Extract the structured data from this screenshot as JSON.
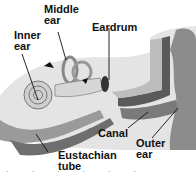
{
  "diagram": {
    "labels": [
      {
        "id": "middle-ear",
        "line1": "Middle",
        "line2": "ear"
      },
      {
        "id": "inner-ear",
        "line1": "Inner",
        "line2": "ear"
      },
      {
        "id": "eardrum",
        "line1": "Eardrum",
        "line2": ""
      },
      {
        "id": "canal",
        "line1": "Canal",
        "line2": ""
      },
      {
        "id": "outer-ear",
        "line1": "Outer",
        "line2": "ear"
      },
      {
        "id": "eustachian-tube",
        "line1": "Eustachian",
        "line2": "tube"
      }
    ],
    "bottom_fragment": "· · ·  ·  ·  ·"
  },
  "colors": {
    "background": "#ffffff",
    "skull_light": "#e6e6e6",
    "skull_mid": "#c8c8c8",
    "canal_dark": "#5a5a5a",
    "outer_ear": "#8c8c8c",
    "text": "#111111"
  }
}
